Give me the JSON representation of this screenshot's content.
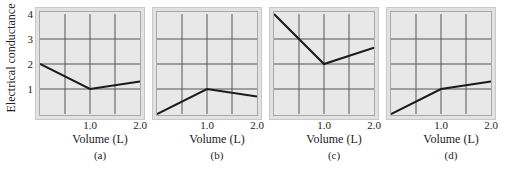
{
  "figure": {
    "y_axis_label": "Electrical conductance",
    "y_ticks": [
      "4",
      "3",
      "2",
      "1"
    ],
    "x_axis_label": "Volume (L)",
    "x_ticks": [
      "1.0",
      "2.0"
    ],
    "panels": [
      {
        "label": "(a)"
      },
      {
        "label": "(b)"
      },
      {
        "label": "(c)"
      },
      {
        "label": "(d)"
      }
    ],
    "colors": {
      "line": "#1a1a1a",
      "grid": "#555555",
      "plot_bg": "#e8e8e8",
      "frame": "#c8c8c8"
    }
  },
  "chart_data": [
    {
      "type": "line",
      "title": "(a)",
      "xlabel": "Volume (L)",
      "ylabel": "Electrical conductance",
      "x": [
        0,
        1.0,
        2.0
      ],
      "values": [
        2,
        1,
        1.3
      ],
      "xlim": [
        0,
        2.0
      ],
      "ylim": [
        0,
        4
      ],
      "x_ticks": [
        "1.0",
        "2.0"
      ],
      "y_ticks": [
        "1",
        "2",
        "3",
        "4"
      ],
      "grid": true
    },
    {
      "type": "line",
      "title": "(b)",
      "xlabel": "Volume (L)",
      "ylabel": "",
      "x": [
        0,
        1.0,
        2.0
      ],
      "values": [
        0,
        1,
        0.7
      ],
      "xlim": [
        0,
        2.0
      ],
      "ylim": [
        0,
        4
      ],
      "x_ticks": [
        "1.0",
        "2.0"
      ],
      "grid": true
    },
    {
      "type": "line",
      "title": "(c)",
      "xlabel": "Volume (L)",
      "ylabel": "",
      "x": [
        0,
        1.0,
        2.0
      ],
      "values": [
        4,
        2,
        2.65
      ],
      "xlim": [
        0,
        2.0
      ],
      "ylim": [
        0,
        4
      ],
      "x_ticks": [
        "1.0",
        "2.0"
      ],
      "grid": true
    },
    {
      "type": "line",
      "title": "(d)",
      "xlabel": "Volume (L)",
      "ylabel": "",
      "x": [
        0,
        1.0,
        2.0
      ],
      "values": [
        0,
        1,
        1.3
      ],
      "xlim": [
        0,
        2.0
      ],
      "ylim": [
        0,
        4
      ],
      "x_ticks": [
        "1.0",
        "2.0"
      ],
      "grid": true
    }
  ]
}
